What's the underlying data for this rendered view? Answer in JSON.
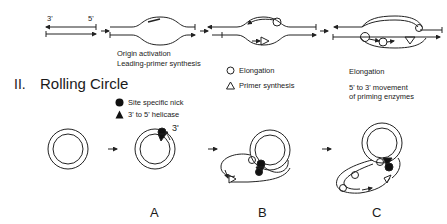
{
  "theta": {
    "end_labels": {
      "left": "3'",
      "right": "5'"
    },
    "stages": [
      {
        "name": "linear-duplex"
      },
      {
        "name": "origin-activation",
        "caption": [
          "Origin activation",
          "Leading-primer synthesis"
        ]
      },
      {
        "name": "primer-synthesis"
      },
      {
        "name": "elongation",
        "caption": [
          "Elongation",
          "",
          "5' to 3' movement",
          "of priming enzymes"
        ]
      }
    ],
    "legend": [
      {
        "icon": "circle-outline-icon",
        "label": "Elongation"
      },
      {
        "icon": "triangle-outline-icon",
        "label": "Primer synthesis"
      }
    ]
  },
  "rolling_circle": {
    "section_number": "II.",
    "section_title": "Rolling Circle",
    "legend": [
      {
        "icon": "filled-circle-icon",
        "label": "Site specific nick"
      },
      {
        "icon": "filled-triangle-icon",
        "label": "3' to 5' helicase"
      }
    ],
    "nick_end_label": "3'",
    "panels": [
      "A",
      "B",
      "C"
    ]
  }
}
